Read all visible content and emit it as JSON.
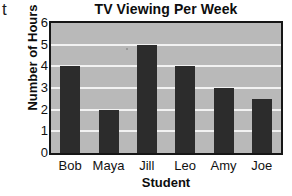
{
  "stray_glyph": "t",
  "chart_data": {
    "type": "bar",
    "title": "TV Viewing Per Week",
    "xlabel": "Student",
    "ylabel": "Number of Hours",
    "categories": [
      "Bob",
      "Maya",
      "Jill",
      "Leo",
      "Amy",
      "Joe"
    ],
    "values": [
      4,
      2,
      5,
      4,
      3,
      2.5
    ],
    "ylim": [
      0,
      6
    ],
    "ytick_labels": [
      "0",
      "1",
      "2",
      "3",
      "4",
      "5",
      "6"
    ],
    "ytick_values": [
      0,
      1,
      2,
      3,
      4,
      5,
      6
    ],
    "gridlines": [
      1,
      2,
      3,
      4,
      5
    ],
    "grid": true,
    "legend": null,
    "colors": {
      "bar": "#2c2c2c",
      "plot_background": "#b9b9b9",
      "gridline": "#f2f2f2",
      "frame": "#161616",
      "text": "#111111",
      "page_background": "#ffffff"
    }
  }
}
